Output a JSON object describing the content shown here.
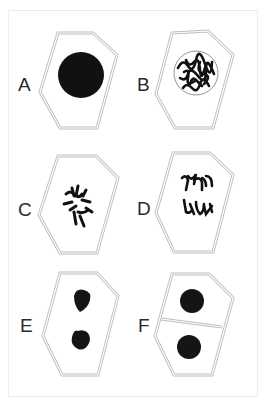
{
  "figure": {
    "colors": {
      "wall": "#bdbdbd",
      "nucleus": "#111111",
      "label": "#2a2a2a",
      "frame": "#ececec"
    },
    "panels": [
      {
        "label": "A",
        "description": "Interphase: single dense nucleus"
      },
      {
        "label": "B",
        "description": "Prophase: chromatin condensing within nuclear envelope"
      },
      {
        "label": "C",
        "description": "Metaphase: chromosomes scattered/aligning"
      },
      {
        "label": "D",
        "description": "Anaphase: chromosomes separating into two groups"
      },
      {
        "label": "E",
        "description": "Telophase: two daughter nuclei forming"
      },
      {
        "label": "F",
        "description": "Cytokinesis: cell plate divides two daughter cells"
      }
    ]
  }
}
